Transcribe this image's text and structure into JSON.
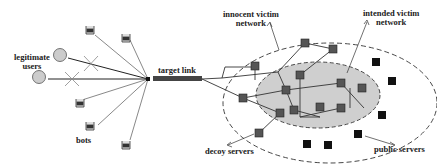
{
  "labels": {
    "legitimate_users": [
      "legitimate",
      "users"
    ],
    "bots": "bots",
    "target_link": "target link",
    "innocent_victim_network": [
      "innocent victim",
      "network"
    ],
    "intended_victim_network": [
      "intended victim",
      "network"
    ],
    "decoy_servers": "decoy servers",
    "public_servers": "public servers"
  },
  "colors": {
    "line": "#333333",
    "node_gray": "#555555",
    "node_black": "#111111",
    "inner_ellipse_fill": "#cfcfcf",
    "user_fill": "#cccccc"
  }
}
